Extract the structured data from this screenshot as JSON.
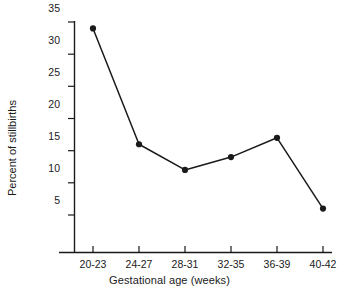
{
  "chart_data": {
    "type": "line",
    "title": "",
    "xlabel": "Gestational age (weeks)",
    "ylabel": "Percent of stillbirths",
    "categories": [
      "20-23",
      "24-27",
      "28-31",
      "32-35",
      "36-39",
      "40-42"
    ],
    "values": [
      34,
      16,
      12,
      14,
      17,
      6
    ],
    "series": [
      {
        "name": "Percent of stillbirths",
        "values": [
          34,
          16,
          12,
          14,
          17,
          6
        ]
      }
    ],
    "ylim": [
      0,
      35
    ],
    "yticks": [
      5,
      10,
      15,
      20,
      25,
      30,
      35
    ],
    "ytick_labels": [
      "5",
      "10",
      "15",
      "20",
      "25",
      "30",
      "35"
    ],
    "xtick_labels": [
      "20-23",
      "24-27",
      "28-31",
      "32-35",
      "36-39",
      "40-42"
    ],
    "grid": false,
    "legend": false,
    "legend_position": "none",
    "marker": "filled-circle",
    "line_color": "#1a1a1a",
    "marker_color": "#1a1a1a",
    "background_color": "#ffffff"
  },
  "axes": {
    "y_title": "Percent of stillbirths",
    "x_title": "Gestational age (weeks)"
  }
}
